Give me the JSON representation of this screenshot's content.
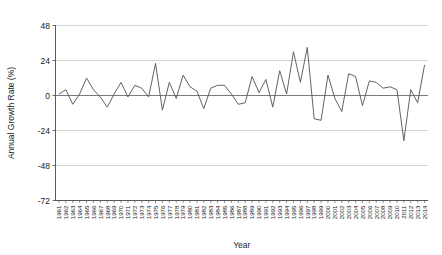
{
  "chart_data": {
    "type": "line",
    "title": "",
    "xlabel": "Year",
    "ylabel": "Annual Growth Rate (%)",
    "ylim": [
      -72,
      48
    ],
    "yticks": [
      48,
      24,
      0,
      -24,
      -48,
      -72
    ],
    "ytick_labels": [
      "48",
      "24",
      "0",
      "-24",
      "-48",
      "-72"
    ],
    "grid": true,
    "grid_axis": "y",
    "legend": false,
    "line_color": "#5a5a5a",
    "grid_color": "#c9c9c9",
    "zero_line_color": "#6b6b6b",
    "axis_color": "#4a4a4a",
    "text_color": "#1a1a1a",
    "background_color": "#ffffff",
    "x": [
      1961,
      1962,
      1963,
      1964,
      1965,
      1966,
      1967,
      1968,
      1969,
      1970,
      1971,
      1972,
      1973,
      1974,
      1975,
      1976,
      1977,
      1978,
      1979,
      1980,
      1981,
      1982,
      1983,
      1984,
      1985,
      1986,
      1987,
      1988,
      1989,
      1990,
      1991,
      1992,
      1993,
      1994,
      1995,
      1996,
      1997,
      1998,
      1999,
      2000,
      2001,
      2002,
      2003,
      2004,
      2005,
      2006,
      2007,
      2008,
      2009,
      2010,
      2011,
      2012,
      2013,
      2014
    ],
    "categories": [
      "1961",
      "1962",
      "1963",
      "1964",
      "1965",
      "1966",
      "1967",
      "1968",
      "1969",
      "1970",
      "1971",
      "1972",
      "1973",
      "1974",
      "1975",
      "1976",
      "1977",
      "1978",
      "1979",
      "1980",
      "1981",
      "1982",
      "1983",
      "1984",
      "1985",
      "1986",
      "1987",
      "1988",
      "1989",
      "1990",
      "1991",
      "1992",
      "1993",
      "1994",
      "1995",
      "1996",
      "1997",
      "1998",
      "1999",
      "2000",
      "2001",
      "2002",
      "2003",
      "2004",
      "2005",
      "2006",
      "2007",
      "2008",
      "2009",
      "2010",
      "2011",
      "2012",
      "2013",
      "2014"
    ],
    "values": [
      1,
      4,
      -6,
      1,
      12,
      4,
      -1,
      -8,
      1,
      9,
      -1,
      7,
      5,
      -1,
      22,
      -10,
      9,
      -2,
      14,
      6,
      3,
      -9,
      5,
      7,
      7,
      1,
      -6,
      -5,
      13,
      2,
      11,
      -8,
      17,
      1,
      30,
      9,
      33,
      -16,
      -17,
      14,
      -2,
      -11,
      15,
      13,
      -7,
      10,
      9,
      5,
      6,
      4,
      -31,
      4,
      -5,
      21
    ],
    "series": [
      {
        "name": "Annual Growth Rate",
        "values": [
          1,
          4,
          -6,
          1,
          12,
          4,
          -1,
          -8,
          1,
          9,
          -1,
          7,
          5,
          -1,
          22,
          -10,
          9,
          -2,
          14,
          6,
          3,
          -9,
          5,
          7,
          7,
          1,
          -6,
          -5,
          13,
          2,
          11,
          -8,
          17,
          1,
          30,
          9,
          33,
          -16,
          -17,
          14,
          -2,
          -11,
          15,
          13,
          -7,
          10,
          9,
          5,
          6,
          4,
          -31,
          4,
          -5,
          21
        ]
      }
    ]
  }
}
